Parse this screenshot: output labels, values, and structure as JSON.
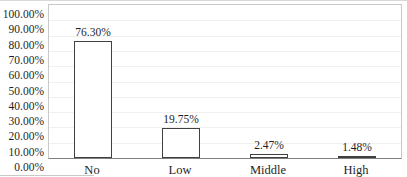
{
  "chart_data": {
    "type": "bar",
    "title": "",
    "xlabel": "",
    "ylabel": "",
    "categories": [
      "No",
      "Low",
      "Middle",
      "High"
    ],
    "values": [
      76.3,
      19.75,
      2.47,
      1.48
    ],
    "data_labels": [
      "76.30%",
      "19.75%",
      "2.47%",
      "1.48%"
    ],
    "y_ticks": [
      "100.00%",
      "90.00%",
      "80.00%",
      "70.00%",
      "60.00%",
      "50.00%",
      "40.00%",
      "30.00%",
      "20.00%",
      "10.00%",
      "0.00%"
    ],
    "ylim": [
      0,
      100
    ],
    "grid": true,
    "legend_position": "none",
    "series_name": ""
  },
  "colors": {
    "bar_fill": "#ffffff",
    "bar_border": "#404040",
    "plot_border": "#c9c9c9",
    "axis_line": "#7f7f7f",
    "gridline": "#f0f0f0",
    "text": "#1f1f1f",
    "background": "#ffffff"
  }
}
